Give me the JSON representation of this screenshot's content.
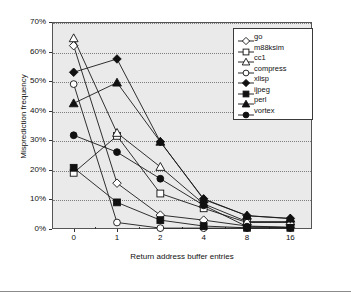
{
  "chart_data": {
    "type": "line",
    "title": "",
    "xlabel": "Return address buffer entries",
    "ylabel": "Misprediction frequency",
    "categories": [
      "0",
      "1",
      "2",
      "4",
      "8",
      "16"
    ],
    "x_tick_labels": [
      "0",
      "1",
      "2",
      "4",
      "8",
      "16"
    ],
    "y_tick_labels": [
      "0%",
      "10%",
      "20%",
      "30%",
      "40%",
      "50%",
      "60%",
      "70%"
    ],
    "y_ticks": [
      0,
      10,
      20,
      30,
      40,
      50,
      60,
      70
    ],
    "ylim": [
      0,
      70
    ],
    "grid": "horizontal-dotted",
    "legend_position": "top-right",
    "series": [
      {
        "name": "go",
        "marker": "open-diamond",
        "values": [
          62.0,
          15.5,
          4.7,
          3.0,
          1.0,
          0.6
        ]
      },
      {
        "name": "m88ksim",
        "marker": "open-square",
        "values": [
          19.0,
          31.5,
          12.0,
          7.0,
          2.2,
          2.2
        ]
      },
      {
        "name": "cc1",
        "marker": "open-triangle",
        "values": [
          64.5,
          32.5,
          21.0,
          8.5,
          2.5,
          2.5
        ]
      },
      {
        "name": "compress",
        "marker": "open-circle",
        "values": [
          49.0,
          2.2,
          0.3,
          0.3,
          0.3,
          0.3
        ]
      },
      {
        "name": "xlisp",
        "marker": "filled-diamond",
        "values": [
          53.0,
          57.5,
          29.5,
          10.2,
          4.5,
          3.6
        ]
      },
      {
        "name": "ijpeg",
        "marker": "filled-square",
        "values": [
          20.7,
          9.0,
          3.0,
          1.0,
          0.4,
          0.4
        ]
      },
      {
        "name": "perl",
        "marker": "filled-triangle",
        "values": [
          42.5,
          49.5,
          29.5,
          10.0,
          4.5,
          3.5
        ]
      },
      {
        "name": "vortex",
        "marker": "filled-circle",
        "values": [
          31.7,
          26.0,
          17.0,
          8.0,
          0.8,
          0.5
        ]
      }
    ]
  },
  "legend": {
    "entries": [
      {
        "label": "go"
      },
      {
        "label": "m88ksim"
      },
      {
        "label": "cc1"
      },
      {
        "label": "compress"
      },
      {
        "label": "xlisp"
      },
      {
        "label": "ijpeg"
      },
      {
        "label": "perl"
      },
      {
        "label": "vortex"
      }
    ]
  },
  "colors": {
    "plot_background": "#eaeaea",
    "page_background": "#ffffff",
    "line": "#1a1a1a",
    "grid": "#7d7d7d",
    "axis": "#555555",
    "text": "#111111"
  }
}
